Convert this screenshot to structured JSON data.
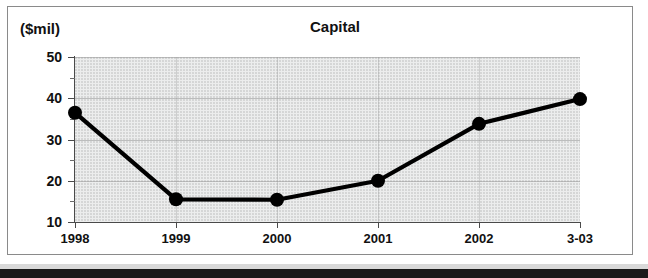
{
  "figure": {
    "units_label": "($mil)",
    "title": "Capital"
  },
  "chart_data": {
    "type": "line",
    "title": "Capital",
    "xlabel": "",
    "ylabel": "($mil)",
    "categories": [
      "1998",
      "1999",
      "2000",
      "2001",
      "2002",
      "3-03"
    ],
    "values": [
      36.5,
      15.5,
      15.4,
      20.0,
      33.8,
      39.8
    ],
    "series": [
      {
        "name": "Capital",
        "values": [
          36.5,
          15.5,
          15.4,
          20.0,
          33.8,
          39.8
        ]
      }
    ],
    "ylim": [
      10,
      50
    ],
    "yticks": [
      10,
      20,
      30,
      40,
      50
    ],
    "ytick_labels": [
      "10",
      "20",
      "30",
      "40",
      "50"
    ],
    "yminor_ticks": [
      15,
      25,
      35,
      45
    ],
    "grid": true,
    "legend": null,
    "marker": "filled-circle",
    "line_color": "#000000",
    "plot_background": "#eceded"
  }
}
